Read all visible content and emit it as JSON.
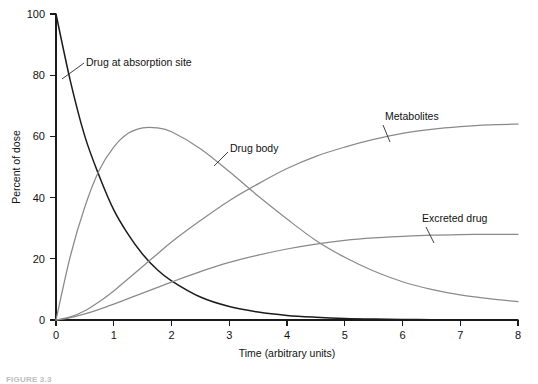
{
  "chart_data": {
    "type": "line",
    "title": "",
    "xlabel": "Time (arbitrary units)",
    "ylabel": "Percent of dose",
    "xlim": [
      0,
      8
    ],
    "ylim": [
      0,
      100
    ],
    "xticks": [
      "0",
      "1",
      "2",
      "3",
      "4",
      "5",
      "6",
      "7",
      "8"
    ],
    "yticks": [
      "0",
      "20",
      "40",
      "60",
      "80",
      "100"
    ],
    "grid": false,
    "legend_position": "inline-annotations",
    "x": [
      0,
      0.25,
      0.5,
      0.75,
      1,
      1.25,
      1.5,
      1.75,
      2,
      2.5,
      3,
      3.5,
      4,
      4.5,
      5,
      5.5,
      6,
      6.5,
      7,
      7.5,
      8
    ],
    "series": [
      {
        "name": "Drug at absorption site",
        "color": "#1b1b1b",
        "values": [
          100,
          78,
          60,
          47,
          36,
          28,
          21.5,
          16.5,
          12.8,
          7.5,
          4.4,
          2.6,
          1.5,
          0.9,
          0.5,
          0.3,
          0.2,
          0.1,
          0.05,
          0.02,
          0
        ]
      },
      {
        "name": "Drug body",
        "color": "#8a8a8a",
        "values": [
          0,
          21,
          37,
          49,
          56.5,
          61,
          62.8,
          62.8,
          61.5,
          56,
          48.5,
          40.5,
          33,
          26,
          20.5,
          16,
          12.5,
          10,
          8.2,
          7,
          6
        ]
      },
      {
        "name": "Metabolites",
        "color": "#8a8a8a",
        "values": [
          0,
          1,
          3,
          6,
          9.5,
          13.5,
          17.5,
          21.5,
          25.5,
          32.5,
          39,
          44.5,
          49.5,
          53.5,
          56.5,
          59,
          61,
          62.3,
          63.2,
          63.8,
          64
        ]
      },
      {
        "name": "Excreted drug",
        "color": "#8a8a8a",
        "values": [
          0,
          0.8,
          2,
          3.5,
          5.2,
          7,
          8.8,
          10.6,
          12.4,
          15.8,
          18.8,
          21.2,
          23.2,
          24.8,
          26,
          26.8,
          27.3,
          27.7,
          27.9,
          28,
          28
        ]
      }
    ],
    "annotations": [
      {
        "text": "Drug at absorption site",
        "x_px": 86,
        "y_px": 66,
        "leader": "M62,79 L84,63"
      },
      {
        "text": "Drug body",
        "x_px": 230,
        "y_px": 152,
        "leader": "M214,166 L228,152"
      },
      {
        "text": "Metabolites",
        "x_px": 385,
        "y_px": 120,
        "leader": "M390,142 L383,125"
      },
      {
        "text": "Excreted drug",
        "x_px": 422,
        "y_px": 222,
        "leader": "M434,243 L426,227"
      }
    ]
  },
  "caption": {
    "label": "FIGURE 3.3",
    "text": ""
  },
  "colors": {
    "axis": "#1a1a1a",
    "dark_curve": "#1b1b1b",
    "gray_curve": "#8a8a8a",
    "background": "#ffffff"
  }
}
